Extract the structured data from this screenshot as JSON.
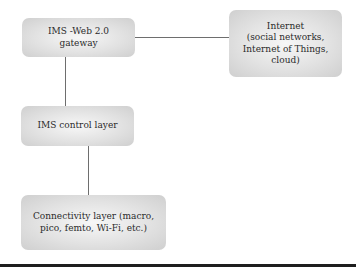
{
  "diagram": {
    "nodes": [
      {
        "id": "gateway",
        "label": "IMS -Web 2.0\ngateway"
      },
      {
        "id": "internet",
        "label": "Internet\n(social networks,\nInternet of Things, cloud)"
      },
      {
        "id": "control",
        "label": "IMS control layer"
      },
      {
        "id": "connectivity",
        "label": "Connectivity layer (macro,\npico, femto, Wi-Fi, etc.)"
      }
    ],
    "edges": [
      {
        "from": "gateway",
        "to": "internet"
      },
      {
        "from": "gateway",
        "to": "control"
      },
      {
        "from": "control",
        "to": "connectivity"
      }
    ],
    "colors": {
      "box_fill": "#e2e2e2",
      "line": "#6e6e6e",
      "rule": "#1e1e1e"
    }
  }
}
